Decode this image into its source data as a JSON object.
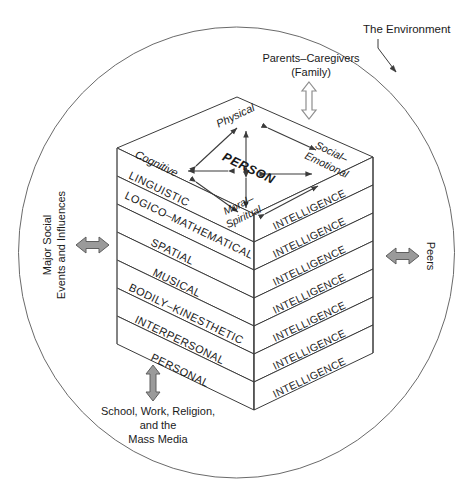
{
  "figure": {
    "type": "conceptual-diagram"
  },
  "environment": {
    "label": "The Environment",
    "boundary_shape": "ellipse"
  },
  "influences": [
    {
      "id": "parents",
      "label_line1": "Parents–Caregivers",
      "label_line2": "(Family)",
      "arrow": "double-vertical",
      "arrow_fill": "#ffffff",
      "position": "top"
    },
    {
      "id": "peers",
      "label_line1": "Peers",
      "label_line2": "",
      "arrow": "double-horizontal",
      "arrow_fill": "#9a9a9a",
      "position": "right"
    },
    {
      "id": "major-social",
      "label_line1": "Major Social",
      "label_line2": "Events and Influences",
      "arrow": "double-horizontal",
      "arrow_fill": "#9a9a9a",
      "position": "left"
    },
    {
      "id": "school-work",
      "label_line1": "School, Work, Religion,",
      "label_line2": "and the",
      "label_line3": "Mass Media",
      "arrow": "double-vertical",
      "arrow_fill": "#9a9a9a",
      "position": "bottom"
    }
  ],
  "person": {
    "center_label": "PERSON",
    "domains": [
      {
        "id": "physical",
        "label_line1": "Physical",
        "label_line2": ""
      },
      {
        "id": "cognitive",
        "label_line1": "Cognitive",
        "label_line2": ""
      },
      {
        "id": "social-emotional",
        "label_line1": "Social–",
        "label_line2": "Emotional"
      },
      {
        "id": "moral-spiritual",
        "label_line1": "Moral–",
        "label_line2": "Spiritual"
      }
    ]
  },
  "intelligences": {
    "right_face_label": "INTELLIGENCE",
    "layers": [
      {
        "index": 1,
        "label": "LINGUISTIC",
        "right_label": "INTELLIGENCE"
      },
      {
        "index": 2,
        "label": "LOGICO–MATHEMATICAL",
        "right_label": "INTELLIGENCE"
      },
      {
        "index": 3,
        "label": "SPATIAL",
        "right_label": "INTELLIGENCE"
      },
      {
        "index": 4,
        "label": "MUSICAL",
        "right_label": "INTELLIGENCE"
      },
      {
        "index": 5,
        "label": "BODILY–KINESTHETIC",
        "right_label": "INTELLIGENCE"
      },
      {
        "index": 6,
        "label": "INTERPERSONAL",
        "right_label": "INTELLIGENCE"
      },
      {
        "index": 7,
        "label": "PERSONAL",
        "right_label": "INTELLIGENCE"
      }
    ]
  },
  "colors": {
    "stroke": "#3b3b3b",
    "text": "#1a1a1a",
    "arrow_gray": "#9a9a9a",
    "arrow_white": "#ffffff",
    "background": "#ffffff"
  }
}
